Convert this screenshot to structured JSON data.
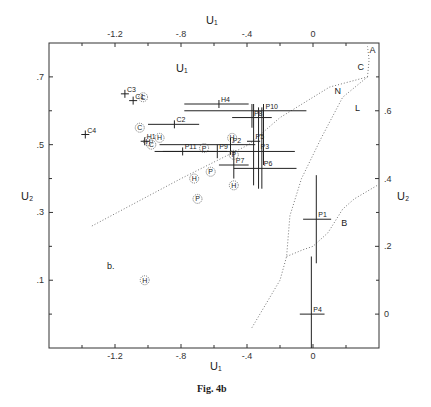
{
  "chart_data": {
    "type": "scatter",
    "title": "",
    "caption": "Fig. 4b",
    "panel_label": "b.",
    "xlabel": "U₁",
    "ylabel": "U₂",
    "xlim": [
      -1.6,
      0.4
    ],
    "ylim": [
      -0.1,
      0.8
    ],
    "grid": false,
    "x_ticks_top": [
      {
        "value": -1.2,
        "label": "-1.2"
      },
      {
        "value": -0.8,
        "label": "-.8"
      },
      {
        "value": -0.4,
        "label": "-.4"
      },
      {
        "value": 0,
        "label": "0"
      }
    ],
    "x_ticks_bottom": [
      {
        "value": -1.2,
        "label": "-1.2"
      },
      {
        "value": -0.8,
        "label": "-.8"
      },
      {
        "value": -0.4,
        "label": "-.4"
      },
      {
        "value": 0,
        "label": "0"
      }
    ],
    "x_minor": [
      -1.4,
      -1.0,
      -0.6,
      -0.2,
      0.2
    ],
    "y_ticks_left": [
      {
        "value": 0.7,
        "label": ".7"
      },
      {
        "value": 0.5,
        "label": ".5"
      },
      {
        "value": 0.3,
        "label": ".3"
      },
      {
        "value": 0.1,
        "label": ".1"
      }
    ],
    "y_minor_left": [
      0.6,
      0.4,
      0.2,
      0.0
    ],
    "y_ticks_right": [
      {
        "value": 0.6,
        "label": ".6"
      },
      {
        "value": 0.4,
        "label": ".4"
      },
      {
        "value": 0.2,
        "label": ".2"
      },
      {
        "value": 0.0,
        "label": "0"
      }
    ],
    "y_minor_right": [
      0.7,
      0.5,
      0.3,
      0.1
    ],
    "crosses": [
      {
        "label": "C3",
        "x": -1.14,
        "y": 0.65
      },
      {
        "label": "C1",
        "x": -1.09,
        "y": 0.63
      },
      {
        "label": "C4",
        "x": -1.38,
        "y": 0.53
      },
      {
        "label": "C2",
        "x": -0.84,
        "y": 0.56,
        "xerr": [
          -1.0,
          -0.69
        ]
      },
      {
        "label": "H1",
        "x": -1.02,
        "y": 0.51
      },
      {
        "label": "P11",
        "x": -0.79,
        "y": 0.48,
        "xerr": [
          -0.96,
          -0.59
        ]
      },
      {
        "label": "H4",
        "x": -0.57,
        "y": 0.62,
        "xerr": [
          -0.78,
          -0.39
        ]
      },
      {
        "label": "P10",
        "x": -0.3,
        "y": 0.6,
        "xerr": [
          -0.78,
          -0.04
        ],
        "yerr": [
          0.44,
          0.62
        ]
      },
      {
        "label": "P8",
        "x": -0.37,
        "y": 0.58,
        "xerr": [
          -0.49,
          -0.25
        ],
        "yerr": [
          0.55,
          0.62
        ]
      },
      {
        "label": "P2",
        "x": -0.5,
        "y": 0.5,
        "xerr": [
          -0.93,
          -0.35
        ],
        "yerr": [
          0.47,
          0.52
        ]
      },
      {
        "label": "P5",
        "x": -0.36,
        "y": 0.51,
        "xerr": [
          -0.4,
          -0.32
        ],
        "yerr": [
          0.38,
          0.62
        ]
      },
      {
        "label": "P9",
        "x": -0.58,
        "y": 0.48,
        "xerr": [
          -0.91,
          -0.52
        ],
        "yerr": [
          0.46,
          0.5
        ]
      },
      {
        "label": "P3",
        "x": -0.33,
        "y": 0.48,
        "xerr": [
          -0.57,
          -0.11
        ],
        "yerr": [
          0.37,
          0.61
        ]
      },
      {
        "label": "P7",
        "x": -0.48,
        "y": 0.44,
        "xerr": [
          -0.57,
          -0.39
        ],
        "yerr": [
          0.4,
          0.48
        ]
      },
      {
        "label": "P6",
        "x": -0.31,
        "y": 0.43,
        "xerr": [
          -0.48,
          -0.1
        ],
        "yerr": [
          0.37,
          0.61
        ]
      },
      {
        "label": "P1",
        "x": 0.02,
        "y": 0.28,
        "xerr": [
          -0.06,
          0.11
        ],
        "yerr": [
          0.15,
          0.41
        ]
      },
      {
        "label": "P4",
        "x": -0.01,
        "y": 0.0,
        "xerr": [
          -0.08,
          0.07
        ],
        "yerr": [
          -0.1,
          0.17
        ]
      }
    ],
    "circled_points": [
      {
        "symbol": "C",
        "x": -1.03,
        "y": 0.64
      },
      {
        "symbol": "C",
        "x": -1.05,
        "y": 0.55
      },
      {
        "symbol": "H",
        "x": -0.93,
        "y": 0.52
      },
      {
        "symbol": "C",
        "x": -0.98,
        "y": 0.5
      },
      {
        "symbol": "H",
        "x": -1.0,
        "y": 0.51
      },
      {
        "symbol": "P",
        "x": -0.66,
        "y": 0.49
      },
      {
        "symbol": "H",
        "x": -0.49,
        "y": 0.52
      },
      {
        "symbol": "P",
        "x": -0.48,
        "y": 0.47
      },
      {
        "symbol": "P",
        "x": -0.62,
        "y": 0.42
      },
      {
        "symbol": "H",
        "x": -0.72,
        "y": 0.4
      },
      {
        "symbol": "H",
        "x": -0.48,
        "y": 0.38
      },
      {
        "symbol": "P",
        "x": -0.7,
        "y": 0.34
      },
      {
        "symbol": "H",
        "x": -1.02,
        "y": 0.1
      }
    ],
    "boundaries": [
      {
        "name": "lower-left",
        "points": [
          [
            -1.34,
            0.26
          ],
          [
            -0.8,
            0.4
          ],
          [
            -0.39,
            0.5
          ],
          [
            -0.2,
            0.58
          ],
          [
            0.1,
            0.67
          ],
          [
            0.33,
            0.7
          ]
        ]
      },
      {
        "name": "right-curve",
        "points": [
          [
            -0.37,
            -0.04
          ],
          [
            -0.2,
            0.1
          ],
          [
            -0.16,
            0.17
          ],
          [
            -0.14,
            0.29
          ],
          [
            -0.07,
            0.4
          ],
          [
            0.05,
            0.52
          ],
          [
            0.18,
            0.64
          ],
          [
            0.33,
            0.7
          ]
        ]
      },
      {
        "name": "lower-B",
        "points": [
          [
            -0.16,
            0.17
          ],
          [
            -0.06,
            0.19
          ],
          [
            0.0,
            0.2
          ],
          [
            0.09,
            0.24
          ],
          [
            0.18,
            0.31
          ],
          [
            0.25,
            0.34
          ],
          [
            0.39,
            0.38
          ]
        ]
      },
      {
        "name": "top-C",
        "points": [
          [
            0.33,
            0.7
          ],
          [
            0.34,
            0.75
          ],
          [
            0.33,
            0.79
          ]
        ]
      }
    ],
    "region_labels": [
      {
        "label": "A",
        "x": 0.36,
        "y": 0.77
      },
      {
        "label": "C",
        "x": 0.29,
        "y": 0.72
      },
      {
        "label": "N",
        "x": 0.15,
        "y": 0.65
      },
      {
        "label": "L",
        "x": 0.27,
        "y": 0.6
      },
      {
        "label": "B",
        "x": 0.19,
        "y": 0.26
      }
    ]
  }
}
